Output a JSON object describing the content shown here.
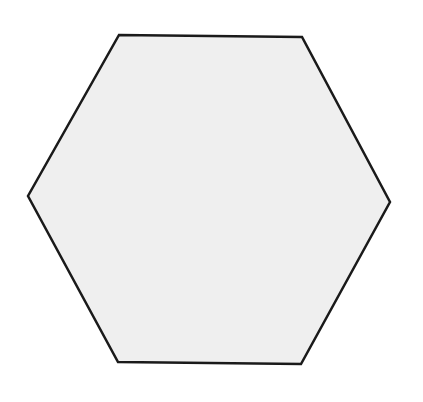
{
  "diagram": {
    "shape": "hexagon",
    "orientation": "flat-top",
    "fill_color": "#efefef",
    "stroke_color": "#1a1a1a",
    "stroke_width": 2.5,
    "background_color": "#ffffff",
    "vertices": [
      {
        "name": "top-left",
        "x": 119,
        "y": 35
      },
      {
        "name": "top-right",
        "x": 302,
        "y": 37
      },
      {
        "name": "right",
        "x": 390,
        "y": 202
      },
      {
        "name": "bottom-right",
        "x": 301,
        "y": 364
      },
      {
        "name": "bottom-left",
        "x": 118,
        "y": 362
      },
      {
        "name": "left",
        "x": 28,
        "y": 196
      }
    ],
    "points": "119,35 302,37 390,202 301,364 118,362 28,196"
  }
}
